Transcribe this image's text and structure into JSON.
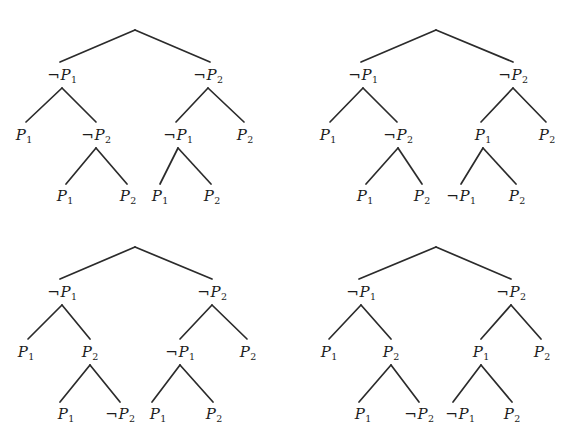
{
  "figure": {
    "width": 582,
    "height": 448,
    "background": "#ffffff",
    "line_color": "#2b2b2b",
    "text_color": "#1c1c1c"
  },
  "symbols": {
    "negation": "¬",
    "proposition": "P",
    "subscript_one": "1",
    "subscript_two": "2"
  },
  "trees": [
    {
      "id": "tree-top-left",
      "name": "top-left-tree",
      "position": {
        "left": 0,
        "top": 0
      },
      "root": {
        "x": 135,
        "y": 30
      },
      "nodes": [
        {
          "id": "tl-n1",
          "name": "node-not-p1-level2-left",
          "text": "¬P1",
          "neg": true,
          "sub": "1",
          "x": 62,
          "y": 75
        },
        {
          "id": "tl-n2",
          "name": "node-not-p2-level2-right",
          "text": "¬P2",
          "neg": true,
          "sub": "2",
          "x": 208,
          "y": 75
        },
        {
          "id": "tl-n3",
          "name": "node-p1-level3-a",
          "text": "P1",
          "neg": false,
          "sub": "1",
          "x": 24,
          "y": 135
        },
        {
          "id": "tl-n4",
          "name": "node-not-p2-level3-b",
          "text": "¬P2",
          "neg": true,
          "sub": "2",
          "x": 96,
          "y": 135
        },
        {
          "id": "tl-n5",
          "name": "node-not-p1-level3-c",
          "text": "¬P1",
          "neg": true,
          "sub": "1",
          "x": 178,
          "y": 135
        },
        {
          "id": "tl-n6",
          "name": "node-p2-level3-d",
          "text": "P2",
          "neg": false,
          "sub": "2",
          "x": 245,
          "y": 135
        },
        {
          "id": "tl-n7",
          "name": "node-p1-leaf-a",
          "text": "P1",
          "neg": false,
          "sub": "1",
          "x": 65,
          "y": 196
        },
        {
          "id": "tl-n8",
          "name": "node-p2-leaf-b",
          "text": "P2",
          "neg": false,
          "sub": "2",
          "x": 128,
          "y": 196
        },
        {
          "id": "tl-n9",
          "name": "node-p1-leaf-c",
          "text": "P1",
          "neg": false,
          "sub": "1",
          "x": 160,
          "y": 196
        },
        {
          "id": "tl-n10",
          "name": "node-p2-leaf-d",
          "text": "P2",
          "neg": false,
          "sub": "2",
          "x": 212,
          "y": 196
        }
      ],
      "edges": [
        {
          "name": "edge-root-to-left",
          "x1": 135,
          "y1": 30,
          "x2": 60,
          "y2": 62
        },
        {
          "name": "edge-root-to-right",
          "x1": 135,
          "y1": 30,
          "x2": 210,
          "y2": 62
        },
        {
          "name": "edge-l2left-to-a",
          "x1": 62,
          "y1": 88,
          "x2": 26,
          "y2": 122
        },
        {
          "name": "edge-l2left-to-b",
          "x1": 62,
          "y1": 88,
          "x2": 96,
          "y2": 122
        },
        {
          "name": "edge-l2right-to-c",
          "x1": 208,
          "y1": 88,
          "x2": 176,
          "y2": 122
        },
        {
          "name": "edge-l2right-to-d",
          "x1": 208,
          "y1": 88,
          "x2": 244,
          "y2": 122
        },
        {
          "name": "edge-b-to-leaf-a",
          "x1": 96,
          "y1": 148,
          "x2": 66,
          "y2": 184
        },
        {
          "name": "edge-b-to-leaf-b",
          "x1": 96,
          "y1": 148,
          "x2": 127,
          "y2": 184
        },
        {
          "name": "edge-c-to-leaf-c",
          "x1": 178,
          "y1": 148,
          "x2": 160,
          "y2": 184
        },
        {
          "name": "edge-c-to-leaf-d",
          "x1": 178,
          "y1": 148,
          "x2": 211,
          "y2": 184
        }
      ]
    },
    {
      "id": "tree-top-right",
      "name": "top-right-tree",
      "position": {
        "left": 291,
        "top": 0
      },
      "root": {
        "x": 145,
        "y": 30
      },
      "nodes": [
        {
          "id": "tr-n1",
          "name": "node-not-p1-level2-left",
          "text": "¬P1",
          "neg": true,
          "sub": "1",
          "x": 72,
          "y": 75
        },
        {
          "id": "tr-n2",
          "name": "node-not-p2-level2-right",
          "text": "¬P2",
          "neg": true,
          "sub": "2",
          "x": 222,
          "y": 75
        },
        {
          "id": "tr-n3",
          "name": "node-p1-level3-a",
          "text": "P1",
          "neg": false,
          "sub": "1",
          "x": 37,
          "y": 135
        },
        {
          "id": "tr-n4",
          "name": "node-not-p2-level3-b",
          "text": "¬P2",
          "neg": true,
          "sub": "2",
          "x": 107,
          "y": 135
        },
        {
          "id": "tr-n5",
          "name": "node-p1-level3-c",
          "text": "P1",
          "neg": false,
          "sub": "1",
          "x": 192,
          "y": 135
        },
        {
          "id": "tr-n6",
          "name": "node-p2-level3-d",
          "text": "P2",
          "neg": false,
          "sub": "2",
          "x": 256,
          "y": 135
        },
        {
          "id": "tr-n7",
          "name": "node-p1-leaf-a",
          "text": "P1",
          "neg": false,
          "sub": "1",
          "x": 74,
          "y": 196
        },
        {
          "id": "tr-n8",
          "name": "node-p2-leaf-b",
          "text": "P2",
          "neg": false,
          "sub": "2",
          "x": 131,
          "y": 196
        },
        {
          "id": "tr-n9",
          "name": "node-not-p1-leaf-c",
          "text": "¬P1",
          "neg": true,
          "sub": "1",
          "x": 170,
          "y": 196
        },
        {
          "id": "tr-n10",
          "name": "node-p2-leaf-d",
          "text": "P2",
          "neg": false,
          "sub": "2",
          "x": 226,
          "y": 196
        }
      ],
      "edges": [
        {
          "name": "edge-root-to-left",
          "x1": 145,
          "y1": 30,
          "x2": 70,
          "y2": 62
        },
        {
          "name": "edge-root-to-right",
          "x1": 145,
          "y1": 30,
          "x2": 222,
          "y2": 62
        },
        {
          "name": "edge-l2left-to-a",
          "x1": 72,
          "y1": 88,
          "x2": 39,
          "y2": 122
        },
        {
          "name": "edge-l2left-to-b",
          "x1": 72,
          "y1": 88,
          "x2": 106,
          "y2": 122
        },
        {
          "name": "edge-l2right-to-c",
          "x1": 222,
          "y1": 88,
          "x2": 190,
          "y2": 122
        },
        {
          "name": "edge-l2right-to-d",
          "x1": 222,
          "y1": 88,
          "x2": 255,
          "y2": 122
        },
        {
          "name": "edge-b-to-leaf-a",
          "x1": 107,
          "y1": 148,
          "x2": 75,
          "y2": 184
        },
        {
          "name": "edge-b-to-leaf-b",
          "x1": 107,
          "y1": 148,
          "x2": 131,
          "y2": 184
        },
        {
          "name": "edge-c-to-leaf-c",
          "x1": 192,
          "y1": 148,
          "x2": 170,
          "y2": 184
        },
        {
          "name": "edge-c-to-leaf-d",
          "x1": 192,
          "y1": 148,
          "x2": 225,
          "y2": 184
        }
      ]
    },
    {
      "id": "tree-bottom-left",
      "name": "bottom-left-tree",
      "position": {
        "left": 0,
        "top": 224
      },
      "root": {
        "x": 135,
        "y": 23
      },
      "nodes": [
        {
          "id": "bl-n1",
          "name": "node-not-p1-level2-left",
          "text": "¬P1",
          "neg": true,
          "sub": "1",
          "x": 62,
          "y": 68
        },
        {
          "id": "bl-n2",
          "name": "node-not-p2-level2-right",
          "text": "¬P2",
          "neg": true,
          "sub": "2",
          "x": 212,
          "y": 68
        },
        {
          "id": "bl-n3",
          "name": "node-p1-level3-a",
          "text": "P1",
          "neg": false,
          "sub": "1",
          "x": 26,
          "y": 128
        },
        {
          "id": "bl-n4",
          "name": "node-p2-level3-b",
          "text": "P2",
          "neg": false,
          "sub": "2",
          "x": 90,
          "y": 128
        },
        {
          "id": "bl-n5",
          "name": "node-not-p1-level3-c",
          "text": "¬P1",
          "neg": true,
          "sub": "1",
          "x": 180,
          "y": 128
        },
        {
          "id": "bl-n6",
          "name": "node-p2-level3-d",
          "text": "P2",
          "neg": false,
          "sub": "2",
          "x": 248,
          "y": 128
        },
        {
          "id": "bl-n7",
          "name": "node-p1-leaf-a",
          "text": "P1",
          "neg": false,
          "sub": "1",
          "x": 66,
          "y": 190
        },
        {
          "id": "bl-n8",
          "name": "node-not-p2-leaf-b",
          "text": "¬P2",
          "neg": true,
          "sub": "2",
          "x": 120,
          "y": 190
        },
        {
          "id": "bl-n9",
          "name": "node-p1-leaf-c",
          "text": "P1",
          "neg": false,
          "sub": "1",
          "x": 158,
          "y": 190
        },
        {
          "id": "bl-n10",
          "name": "node-p2-leaf-d",
          "text": "P2",
          "neg": false,
          "sub": "2",
          "x": 214,
          "y": 190
        }
      ],
      "edges": [
        {
          "name": "edge-root-to-left",
          "x1": 135,
          "y1": 23,
          "x2": 60,
          "y2": 55
        },
        {
          "name": "edge-root-to-right",
          "x1": 135,
          "y1": 23,
          "x2": 212,
          "y2": 55
        },
        {
          "name": "edge-l2left-to-a",
          "x1": 62,
          "y1": 81,
          "x2": 28,
          "y2": 115
        },
        {
          "name": "edge-l2left-to-b",
          "x1": 62,
          "y1": 81,
          "x2": 90,
          "y2": 115
        },
        {
          "name": "edge-l2right-to-c",
          "x1": 212,
          "y1": 81,
          "x2": 180,
          "y2": 115
        },
        {
          "name": "edge-l2right-to-d",
          "x1": 212,
          "y1": 81,
          "x2": 247,
          "y2": 115
        },
        {
          "name": "edge-b-to-leaf-a",
          "x1": 90,
          "y1": 141,
          "x2": 60,
          "y2": 178
        },
        {
          "name": "edge-b-to-leaf-b",
          "x1": 90,
          "y1": 141,
          "x2": 120,
          "y2": 178
        },
        {
          "name": "edge-c-to-leaf-c",
          "x1": 180,
          "y1": 141,
          "x2": 152,
          "y2": 178
        },
        {
          "name": "edge-c-to-leaf-d",
          "x1": 180,
          "y1": 141,
          "x2": 213,
          "y2": 178
        }
      ]
    },
    {
      "id": "tree-bottom-right",
      "name": "bottom-right-tree",
      "position": {
        "left": 291,
        "top": 224
      },
      "root": {
        "x": 145,
        "y": 23
      },
      "nodes": [
        {
          "id": "br-n1",
          "name": "node-not-p1-level2-left",
          "text": "¬P1",
          "neg": true,
          "sub": "1",
          "x": 70,
          "y": 68
        },
        {
          "id": "br-n2",
          "name": "node-not-p2-level2-right",
          "text": "¬P2",
          "neg": true,
          "sub": "2",
          "x": 220,
          "y": 68
        },
        {
          "id": "br-n3",
          "name": "node-p1-level3-a",
          "text": "P1",
          "neg": false,
          "sub": "1",
          "x": 38,
          "y": 128
        },
        {
          "id": "br-n4",
          "name": "node-p2-level3-b",
          "text": "P2",
          "neg": false,
          "sub": "2",
          "x": 100,
          "y": 128
        },
        {
          "id": "br-n5",
          "name": "node-p1-level3-c",
          "text": "P1",
          "neg": false,
          "sub": "1",
          "x": 190,
          "y": 128
        },
        {
          "id": "br-n6",
          "name": "node-p2-level3-d",
          "text": "P2",
          "neg": false,
          "sub": "2",
          "x": 251,
          "y": 128
        },
        {
          "id": "br-n7",
          "name": "node-p1-leaf-a",
          "text": "P1",
          "neg": false,
          "sub": "1",
          "x": 72,
          "y": 190
        },
        {
          "id": "br-n8",
          "name": "node-not-p2-leaf-b",
          "text": "¬P2",
          "neg": true,
          "sub": "2",
          "x": 128,
          "y": 190
        },
        {
          "id": "br-n9",
          "name": "node-not-p1-leaf-c",
          "text": "¬P1",
          "neg": true,
          "sub": "1",
          "x": 169,
          "y": 190
        },
        {
          "id": "br-n10",
          "name": "node-p2-leaf-d",
          "text": "P2",
          "neg": false,
          "sub": "2",
          "x": 221,
          "y": 190
        }
      ],
      "edges": [
        {
          "name": "edge-root-to-left",
          "x1": 145,
          "y1": 23,
          "x2": 68,
          "y2": 55
        },
        {
          "name": "edge-root-to-right",
          "x1": 145,
          "y1": 23,
          "x2": 220,
          "y2": 55
        },
        {
          "name": "edge-l2left-to-a",
          "x1": 70,
          "y1": 81,
          "x2": 38,
          "y2": 115
        },
        {
          "name": "edge-l2left-to-b",
          "x1": 70,
          "y1": 81,
          "x2": 100,
          "y2": 115
        },
        {
          "name": "edge-l2right-to-c",
          "x1": 220,
          "y1": 81,
          "x2": 190,
          "y2": 115
        },
        {
          "name": "edge-l2right-to-d",
          "x1": 220,
          "y1": 81,
          "x2": 250,
          "y2": 115
        },
        {
          "name": "edge-b-to-leaf-a",
          "x1": 100,
          "y1": 141,
          "x2": 68,
          "y2": 178
        },
        {
          "name": "edge-b-to-leaf-b",
          "x1": 100,
          "y1": 141,
          "x2": 128,
          "y2": 178
        },
        {
          "name": "edge-c-to-leaf-c",
          "x1": 190,
          "y1": 141,
          "x2": 162,
          "y2": 178
        },
        {
          "name": "edge-c-to-leaf-d",
          "x1": 190,
          "y1": 141,
          "x2": 221,
          "y2": 178
        }
      ]
    }
  ]
}
